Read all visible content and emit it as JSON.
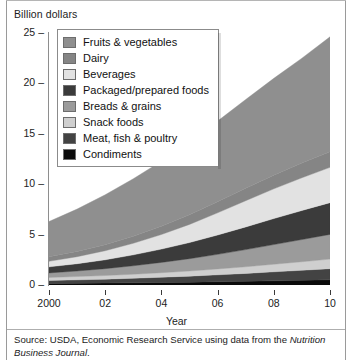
{
  "figure": {
    "y_axis_title": "Billion dollars",
    "x_axis_title": "Year",
    "source_prefix": "Source: USDA, Economic Research Service using data from the ",
    "source_italic": "Nutrition Business Journal",
    "source_suffix": "."
  },
  "legend": {
    "items": [
      {
        "label": "Fruits & vegetables",
        "color": "#8f8f8f"
      },
      {
        "label": "Dairy",
        "color": "#858585"
      },
      {
        "label": "Beverages",
        "color": "#e2e2e2"
      },
      {
        "label": "Packaged/prepared foods",
        "color": "#3b3b3b"
      },
      {
        "label": "Breads & grains",
        "color": "#9b9b9b"
      },
      {
        "label": "Snack foods",
        "color": "#cfcfcf"
      },
      {
        "label": "Meat, fish & poultry",
        "color": "#434343"
      },
      {
        "label": "Condiments",
        "color": "#0a0a0a"
      }
    ]
  },
  "chart_data": {
    "type": "area",
    "stacked": true,
    "title": "",
    "xlabel": "Year",
    "ylabel": "Billion dollars",
    "x": [
      2000,
      2001,
      2002,
      2003,
      2004,
      2005,
      2006,
      2007,
      2008,
      2009,
      2010
    ],
    "x_tick_values": [
      2000,
      2002,
      2004,
      2006,
      2008,
      2010
    ],
    "x_tick_labels": [
      "2000",
      "02",
      "04",
      "06",
      "08",
      "10"
    ],
    "xlim": [
      2000,
      2010
    ],
    "ylim": [
      0,
      25
    ],
    "y_ticks": [
      0,
      5,
      10,
      15,
      20,
      25
    ],
    "y_tick_labels": [
      "0",
      "5",
      "10",
      "15",
      "20",
      "25"
    ],
    "grid": false,
    "legend_position": "upper-left-inside",
    "series": [
      {
        "name": "Condiments",
        "color": "#0a0a0a",
        "values": [
          0.15,
          0.17,
          0.19,
          0.22,
          0.25,
          0.28,
          0.32,
          0.36,
          0.41,
          0.46,
          0.52
        ]
      },
      {
        "name": "Meat, fish & poultry",
        "color": "#434343",
        "values": [
          0.3,
          0.34,
          0.39,
          0.45,
          0.52,
          0.6,
          0.69,
          0.79,
          0.9,
          1.0,
          1.1
        ]
      },
      {
        "name": "Snack foods",
        "color": "#cfcfcf",
        "values": [
          0.3,
          0.33,
          0.36,
          0.4,
          0.45,
          0.51,
          0.58,
          0.66,
          0.75,
          0.85,
          0.95
        ]
      },
      {
        "name": "Breads & grains",
        "color": "#9b9b9b",
        "values": [
          0.45,
          0.55,
          0.68,
          0.84,
          1.02,
          1.22,
          1.45,
          1.7,
          1.95,
          2.2,
          2.45
        ]
      },
      {
        "name": "Packaged/prepared foods",
        "color": "#3b3b3b",
        "values": [
          0.6,
          0.72,
          0.88,
          1.08,
          1.32,
          1.6,
          1.92,
          2.25,
          2.58,
          2.88,
          3.15
        ]
      },
      {
        "name": "Beverages",
        "color": "#e2e2e2",
        "values": [
          0.55,
          0.7,
          0.9,
          1.15,
          1.45,
          1.8,
          2.2,
          2.6,
          2.95,
          3.25,
          3.5
        ]
      },
      {
        "name": "Dairy",
        "color": "#858585",
        "values": [
          0.45,
          0.52,
          0.6,
          0.7,
          0.82,
          0.96,
          1.1,
          1.24,
          1.36,
          1.46,
          1.55
        ]
      },
      {
        "name": "Fruits & vegetables",
        "color": "#8f8f8f",
        "values": [
          3.5,
          4.2,
          4.95,
          5.7,
          6.45,
          7.2,
          8.0,
          8.8,
          9.6,
          10.4,
          11.4
        ]
      }
    ],
    "totals": [
      6.3,
      7.53,
      8.95,
      10.54,
      12.28,
      14.17,
      16.26,
      18.4,
      20.5,
      22.5,
      24.62
    ]
  }
}
